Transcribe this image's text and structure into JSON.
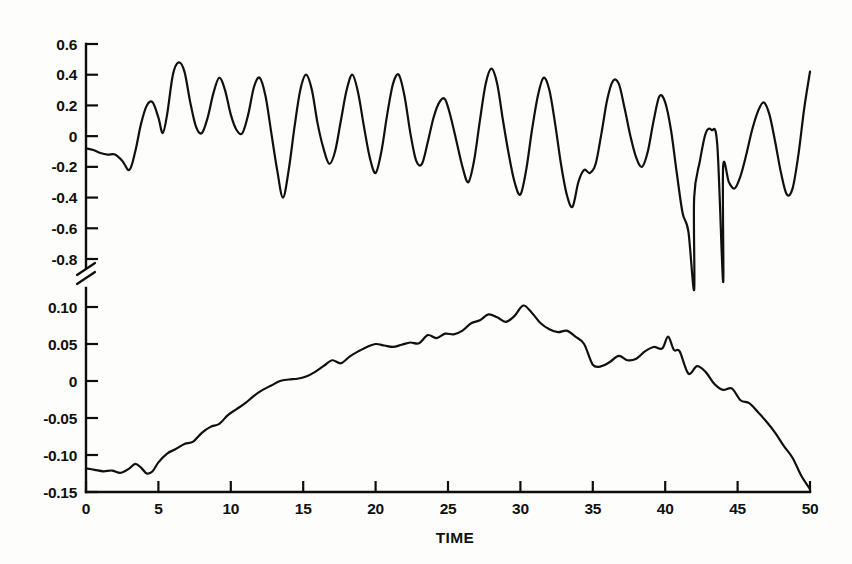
{
  "figure": {
    "background_color": "#fdfdfb",
    "ink_color": "#101010"
  },
  "chart_data": {
    "type": "line",
    "title": "",
    "subtitle": "",
    "xlabel": "TIME",
    "ylabel": "",
    "grid": false,
    "legend": "none",
    "axis_break": {
      "present": true,
      "symbol": "double-slash",
      "between": [
        -0.8,
        0.1
      ],
      "note": "Vertical axis is broken; upper panel and lower panel use different scales"
    },
    "xlim": [
      0,
      50
    ],
    "xticks": [
      0,
      5,
      10,
      15,
      20,
      25,
      30,
      35,
      40,
      45,
      50
    ],
    "xticklabels": [
      "0",
      "5",
      "10",
      "15",
      "20",
      "25",
      "30",
      "35",
      "40",
      "45",
      "50"
    ],
    "panels": [
      {
        "name": "upper-panel",
        "ylim": [
          -1.05,
          0.65
        ],
        "yticks": [
          0.6,
          0.4,
          0.2,
          0,
          -0.2,
          -0.4,
          -0.6,
          -0.8
        ],
        "yticklabels": [
          "0.6",
          "0.4",
          "0.2",
          "0",
          "-0.2",
          "-0.4",
          "-0.6",
          "-0.8"
        ],
        "series": [
          {
            "name": "upper-trace",
            "x": [
              0.0,
              0.5,
              1.0,
              1.5,
              2.0,
              2.5,
              3.0,
              3.4,
              3.8,
              4.2,
              4.6,
              5.0,
              5.3,
              5.6,
              6.0,
              6.4,
              6.8,
              7.2,
              7.6,
              8.0,
              8.4,
              8.8,
              9.2,
              9.6,
              10.0,
              10.4,
              10.8,
              11.2,
              11.6,
              12.0,
              12.4,
              12.8,
              13.2,
              13.6,
              14.0,
              14.4,
              14.8,
              15.2,
              15.6,
              16.0,
              16.4,
              16.8,
              17.2,
              17.6,
              18.0,
              18.4,
              18.8,
              19.2,
              19.6,
              20.0,
              20.4,
              20.8,
              21.2,
              21.6,
              22.0,
              22.4,
              22.8,
              23.2,
              23.6,
              24.0,
              24.4,
              24.8,
              25.2,
              25.6,
              26.0,
              26.4,
              26.8,
              27.2,
              27.6,
              28.0,
              28.4,
              28.8,
              29.2,
              29.6,
              30.0,
              30.4,
              30.8,
              31.2,
              31.6,
              32.0,
              32.4,
              32.8,
              33.2,
              33.6,
              34.0,
              34.4,
              34.8,
              35.2,
              35.6,
              36.0,
              36.4,
              36.8,
              37.2,
              37.6,
              38.0,
              38.4,
              38.8,
              39.2,
              39.6,
              40.0,
              40.4,
              40.8,
              41.2,
              41.6,
              42.0,
              42.4,
              42.8,
              43.2,
              43.6,
              44.0,
              44.4,
              44.8,
              45.2,
              45.6,
              46.0,
              46.4,
              46.8,
              47.2,
              47.6,
              48.0,
              48.4,
              48.8,
              49.2,
              49.6,
              50.0
            ],
            "y": [
              -0.08,
              -0.09,
              -0.11,
              -0.12,
              -0.12,
              -0.16,
              -0.22,
              -0.1,
              0.08,
              0.2,
              0.22,
              0.12,
              0.02,
              0.14,
              0.4,
              0.48,
              0.42,
              0.22,
              0.06,
              0.02,
              0.12,
              0.28,
              0.38,
              0.3,
              0.14,
              0.04,
              0.02,
              0.14,
              0.32,
              0.38,
              0.26,
              0.02,
              -0.22,
              -0.4,
              -0.22,
              0.06,
              0.3,
              0.4,
              0.3,
              0.08,
              -0.08,
              -0.18,
              -0.1,
              0.1,
              0.3,
              0.4,
              0.28,
              0.06,
              -0.14,
              -0.24,
              -0.1,
              0.14,
              0.34,
              0.4,
              0.26,
              0.02,
              -0.16,
              -0.18,
              -0.04,
              0.12,
              0.22,
              0.24,
              0.12,
              -0.04,
              -0.2,
              -0.3,
              -0.16,
              0.1,
              0.34,
              0.44,
              0.34,
              0.1,
              -0.12,
              -0.3,
              -0.38,
              -0.22,
              0.04,
              0.26,
              0.38,
              0.3,
              0.08,
              -0.18,
              -0.38,
              -0.46,
              -0.3,
              -0.22,
              -0.24,
              -0.18,
              0.02,
              0.24,
              0.36,
              0.34,
              0.18,
              0.0,
              -0.14,
              -0.2,
              -0.1,
              0.1,
              0.26,
              0.22,
              0.04,
              -0.24,
              -0.5,
              -0.62,
              -0.4,
              -0.16,
              0.02,
              0.04,
              -0.06,
              -0.2,
              -0.3,
              -0.34,
              -0.26,
              -0.12,
              0.04,
              0.16,
              0.22,
              0.14,
              -0.04,
              -0.24,
              -0.38,
              -0.34,
              -0.12,
              0.18,
              0.42,
              0.52,
              0.38,
              0.25
            ],
            "extreme_troughs": [
              {
                "x": 42.0,
                "y": -1.0,
                "note": "deepest dip, extends past the axis break"
              },
              {
                "x": 44.0,
                "y": -0.95,
                "note": "second deep dip"
              }
            ]
          }
        ]
      },
      {
        "name": "lower-panel",
        "ylim": [
          -0.15,
          0.115
        ],
        "yticks": [
          0.1,
          0.05,
          0,
          -0.05,
          -0.1,
          -0.15
        ],
        "yticklabels": [
          "0.10",
          "0.05",
          "0",
          "-0.05",
          "-0.10",
          "-0.15"
        ],
        "series": [
          {
            "name": "lower-trace",
            "x": [
              0.0,
              0.6,
              1.2,
              1.8,
              2.4,
              3.0,
              3.4,
              3.8,
              4.2,
              4.6,
              5.0,
              5.6,
              6.2,
              6.8,
              7.4,
              8.0,
              8.6,
              9.2,
              9.8,
              10.4,
              11.0,
              11.6,
              12.2,
              12.8,
              13.4,
              14.0,
              14.6,
              15.2,
              15.8,
              16.4,
              17.0,
              17.6,
              18.2,
              18.8,
              19.4,
              20.0,
              20.6,
              21.2,
              21.8,
              22.4,
              23.0,
              23.6,
              24.2,
              24.8,
              25.4,
              26.0,
              26.6,
              27.2,
              27.8,
              28.4,
              29.0,
              29.6,
              30.2,
              30.8,
              31.4,
              32.0,
              32.6,
              33.2,
              33.8,
              34.4,
              35.0,
              35.6,
              36.2,
              36.8,
              37.4,
              38.0,
              38.6,
              39.2,
              39.8,
              40.2,
              40.6,
              41.0,
              41.6,
              42.2,
              42.8,
              43.4,
              44.0,
              44.6,
              45.2,
              45.8,
              46.4,
              47.0,
              47.6,
              48.2,
              48.8,
              49.4,
              50.0
            ],
            "y": [
              -0.118,
              -0.12,
              -0.122,
              -0.121,
              -0.124,
              -0.118,
              -0.112,
              -0.117,
              -0.125,
              -0.122,
              -0.11,
              -0.098,
              -0.092,
              -0.085,
              -0.082,
              -0.07,
              -0.062,
              -0.058,
              -0.046,
              -0.038,
              -0.03,
              -0.02,
              -0.012,
              -0.006,
              0.0,
              0.002,
              0.003,
              0.006,
              0.012,
              0.02,
              0.028,
              0.024,
              0.033,
              0.04,
              0.046,
              0.05,
              0.048,
              0.046,
              0.049,
              0.052,
              0.051,
              0.062,
              0.058,
              0.064,
              0.063,
              0.068,
              0.078,
              0.082,
              0.09,
              0.086,
              0.08,
              0.088,
              0.102,
              0.092,
              0.078,
              0.07,
              0.066,
              0.068,
              0.06,
              0.05,
              0.022,
              0.02,
              0.026,
              0.034,
              0.028,
              0.03,
              0.04,
              0.046,
              0.044,
              0.06,
              0.042,
              0.04,
              0.01,
              0.02,
              0.012,
              -0.004,
              -0.012,
              -0.01,
              -0.026,
              -0.03,
              -0.042,
              -0.055,
              -0.07,
              -0.088,
              -0.104,
              -0.128,
              -0.146
            ],
            "peak": {
              "x": 30.2,
              "y": 0.105
            },
            "minimum_end": {
              "x": 50.0,
              "y": -0.147
            }
          }
        ]
      }
    ]
  }
}
